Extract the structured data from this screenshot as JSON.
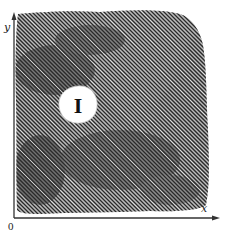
{
  "figure": {
    "type": "hatched-region-diagram",
    "axes": {
      "x_label": "x",
      "y_label": "y",
      "origin_label": "0"
    },
    "region": {
      "fill_style": "diagonal-hatching",
      "hatch_color": "#3a3a3a",
      "shade_color": "#555555"
    },
    "hole": {
      "label": "I",
      "fill": "#ffffff"
    }
  }
}
